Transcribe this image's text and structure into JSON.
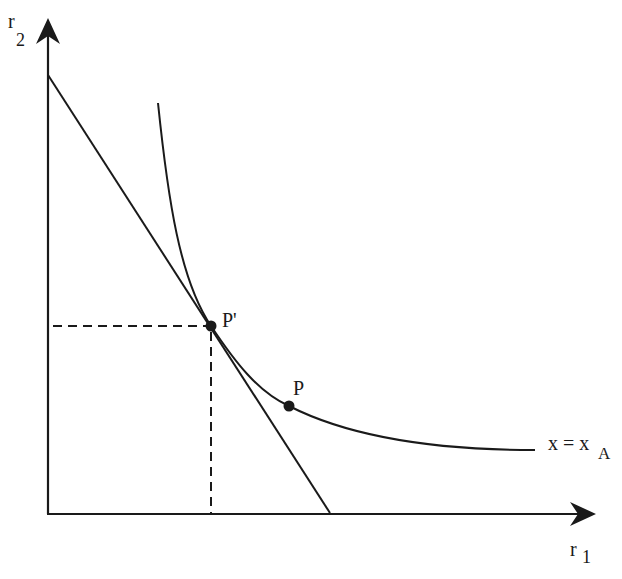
{
  "diagram": {
    "type": "isoquant-tangency",
    "axes": {
      "x_label_main": "r",
      "x_label_sub": "1",
      "y_label_main": "r",
      "y_label_sub": "2"
    },
    "curve_label": {
      "main": "x = x",
      "sub": "A"
    },
    "points": [
      {
        "id": "P_prime",
        "label": "P'"
      },
      {
        "id": "P",
        "label": "P"
      }
    ],
    "elements": [
      "vertical axis r2 with arrow",
      "horizontal axis r1 with arrow",
      "convex isoquant curve x = xA",
      "straight budget/isocost line tangent at P'",
      "dashed projection lines from P' to both axes"
    ],
    "colors": {
      "line": "#1a1a1a",
      "background": "#ffffff"
    }
  }
}
